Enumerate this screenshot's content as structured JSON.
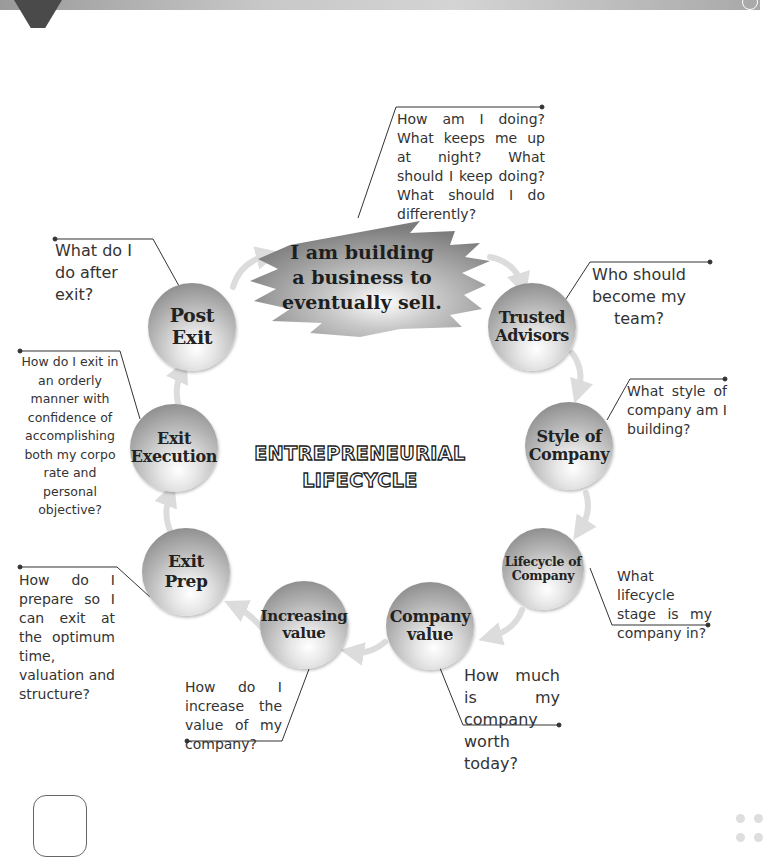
{
  "page": {
    "decor": {
      "top_tab": "dark-tab-shape",
      "bottom_box": "rounded-square-outline",
      "bottom_right_dots": 4
    }
  },
  "diagram": {
    "title": "ENTREPRENEURIAL\nLIFECYCLE",
    "center": {
      "label": "I am building\na business to\neventually sell.",
      "question": "How am I doing? What keeps me up at night? What should I keep doing? What should I do differently?"
    },
    "stages": [
      {
        "id": "trusted-advisors",
        "label": "Trusted\nAdvisors",
        "question": "Who should become my team?"
      },
      {
        "id": "style-of-company",
        "label": "Style of\nCompany",
        "question": "What style of company am I building?"
      },
      {
        "id": "lifecycle-of-company",
        "label": "Lifecycle of\nCompany",
        "question": "What lifecycle stage is my company in?"
      },
      {
        "id": "company-value",
        "label": "Company\nvalue",
        "question": "How much is my company worth today?"
      },
      {
        "id": "increasing-value",
        "label": "Increasing\nvalue",
        "question": "How do I increase the value of my company?"
      },
      {
        "id": "exit-prep",
        "label": "Exit\nPrep",
        "question": "How do I prepare so I can exit at the optimum time, valuation and structure?"
      },
      {
        "id": "exit-execution",
        "label": "Exit\nExecution",
        "question": "How do I exit in an orderly manner with confidence of accomplishing both my corpo rate and personal objective?"
      },
      {
        "id": "post-exit",
        "label": "Post\nExit",
        "question": "What do I do after exit?"
      }
    ],
    "colors": {
      "text": "#333333",
      "node_dark": "#7a7a7a",
      "node_light": "#ffffff",
      "arrow": "#dcdcdc",
      "leader_line": "#333333"
    }
  }
}
